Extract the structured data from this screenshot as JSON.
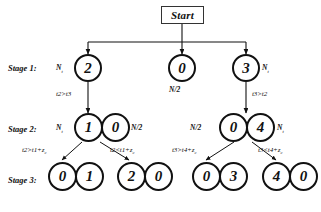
{
  "figure": {
    "start": {
      "label": "Start"
    },
    "stage_labels": [
      {
        "id": "stage-1",
        "text": "Stage 1:"
      },
      {
        "id": "stage-2",
        "text": "Stage 2:"
      },
      {
        "id": "stage-3",
        "text": "Stage 3:"
      }
    ],
    "stage1": {
      "nodes": [
        {
          "value": "2",
          "capacity": "N",
          "capacity_sub": "t",
          "capacity_side": "left"
        },
        {
          "value": "0",
          "capacity": "N/2",
          "capacity_sub": "",
          "capacity_side": "below"
        },
        {
          "value": "3",
          "capacity": "N",
          "capacity_sub": "t",
          "capacity_side": "right"
        }
      ]
    },
    "stage2": {
      "left_pair": [
        {
          "value": "1",
          "capacity": "N",
          "capacity_sub": "t",
          "capacity_side": "left"
        },
        {
          "value": "0",
          "capacity": "N/2",
          "capacity_sub": "",
          "capacity_side": "right"
        }
      ],
      "right_pair": [
        {
          "value": "0",
          "capacity": "N/2",
          "capacity_sub": "",
          "capacity_side": "left"
        },
        {
          "value": "4",
          "capacity": "N",
          "capacity_sub": "t",
          "capacity_side": "right"
        }
      ]
    },
    "stage3": {
      "groups": [
        {
          "nodes": [
            "0",
            "1"
          ]
        },
        {
          "nodes": [
            "2",
            "0"
          ]
        },
        {
          "nodes": [
            "0",
            "3"
          ]
        },
        {
          "nodes": [
            "4",
            "0"
          ]
        }
      ]
    },
    "edge_labels": {
      "s1_left": "t2>t3",
      "s1_right": "t3>t2",
      "s2_ll": "t2>t1+z",
      "s2_ll_sub": "c",
      "s2_lr": "t2<t1+z",
      "s2_lr_sub": "c",
      "s2_rl": "t3>t4+z",
      "s2_rl_sub": "c",
      "s2_rr": "t3<t4+z",
      "s2_rr_sub": "c"
    },
    "colors": {
      "stroke": "#111111",
      "background": "#ffffff",
      "box_stroke": "#333333"
    }
  }
}
